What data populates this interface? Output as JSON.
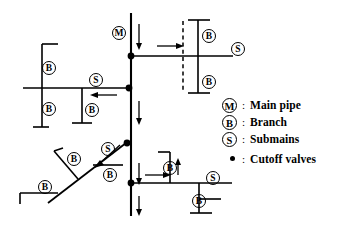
{
  "diagram": {
    "stroke_color": "#000000",
    "background_color": "#ffffff",
    "symbols": {
      "main_pipe": "M",
      "branch": "B",
      "submains": "S"
    },
    "labels": {
      "main_pipe_top": "M",
      "submain_top_right": "S",
      "submain_left": "S",
      "submain_diagonal": "S",
      "submain_bottom_right": "S",
      "branch_top_right_upper": "B",
      "branch_top_right_lower": "B",
      "branch_left_upper": "B",
      "branch_left_lower": "B",
      "branch_left_mid": "B",
      "branch_diagonal_upper": "B",
      "branch_diagonal_lower": "B",
      "branch_diagonal_right": "B",
      "branch_bottom_right_upper": "B",
      "branch_bottom_right_lower": "B"
    },
    "cutoff_valve_count": 4
  },
  "legend": {
    "items": [
      {
        "symbol": "M",
        "kind": "circle-letter",
        "separator": ":",
        "label": "Main pipe"
      },
      {
        "symbol": "B",
        "kind": "circle-letter",
        "separator": ":",
        "label": "Branch"
      },
      {
        "symbol": "S",
        "kind": "circle-letter",
        "separator": ":",
        "label": "Submains"
      },
      {
        "symbol": "dot",
        "kind": "dot",
        "separator": ":",
        "label": "Cutoff valves"
      }
    ]
  }
}
